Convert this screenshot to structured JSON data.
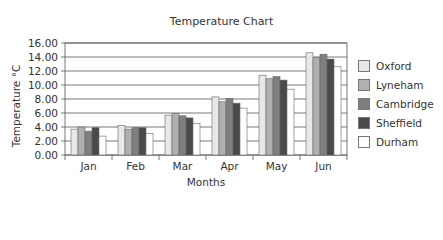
{
  "chart_data": {
    "type": "bar",
    "title": "Temperature Chart",
    "xlabel": "Months",
    "ylabel": "Temperature °C",
    "ylim": [
      0,
      16
    ],
    "yticks": [
      "0.00",
      "2.00",
      "4.00",
      "6.00",
      "8.00",
      "10.00",
      "12.00",
      "14.00",
      "16.00"
    ],
    "categories": [
      "Jan",
      "Feb",
      "Mar",
      "Apr",
      "May",
      "Jun"
    ],
    "grid": true,
    "legend_position": "right",
    "series": [
      {
        "name": "Oxford",
        "color": "#e8e8e8",
        "values": [
          3.7,
          4.2,
          5.7,
          8.3,
          11.4,
          14.6
        ]
      },
      {
        "name": "Lyneham",
        "color": "#b0b0b0",
        "values": [
          4.0,
          3.7,
          5.9,
          7.6,
          10.9,
          13.9
        ]
      },
      {
        "name": "Cambridge",
        "color": "#7f7f7f",
        "values": [
          3.4,
          3.9,
          5.6,
          8.1,
          11.2,
          14.4
        ]
      },
      {
        "name": "Sheffield",
        "color": "#4a4a4a",
        "values": [
          3.9,
          3.9,
          5.3,
          7.4,
          10.7,
          13.7
        ]
      },
      {
        "name": "Durham",
        "color": "#ffffff",
        "values": [
          2.7,
          3.1,
          4.5,
          6.7,
          9.4,
          12.6
        ]
      }
    ]
  }
}
